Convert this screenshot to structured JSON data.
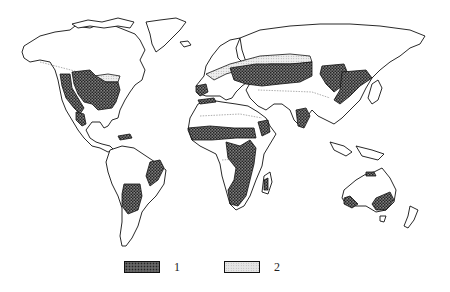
{
  "map": {
    "type": "world-distribution-map",
    "style": "black-and-white line map with stippled/hatched zones",
    "regions_zone1": [
      "North America - Great Plains / Midwest / eastern US",
      "North America - western US intermontane",
      "Mexico - northern plateau",
      "Central America - Honduras coast",
      "Brazil - eastern highlands",
      "South America - Pampas / Argentina",
      "Iberian Peninsula",
      "North Africa - Maghreb strip",
      "Sahel belt",
      "Eastern & Southern Africa",
      "Madagascar - western",
      "Eastern Europe / Ukraine / Southern Russia steppe",
      "Central Asia / Kazakhstan",
      "Ethiopia highlands",
      "India - Deccan",
      "Manchuria / Northeast China",
      "North China Plain",
      "Australia - northern coast",
      "Australia - southwest",
      "Australia - southeast"
    ],
    "regions_zone2": [
      "Canada - southern prairie belt",
      "Europe / Russia - mixed forest belt north of steppe"
    ]
  },
  "legend": {
    "items": [
      {
        "id": "1",
        "label": "1",
        "pattern": "dark-stipple"
      },
      {
        "id": "2",
        "label": "2",
        "pattern": "light-stipple"
      }
    ]
  }
}
